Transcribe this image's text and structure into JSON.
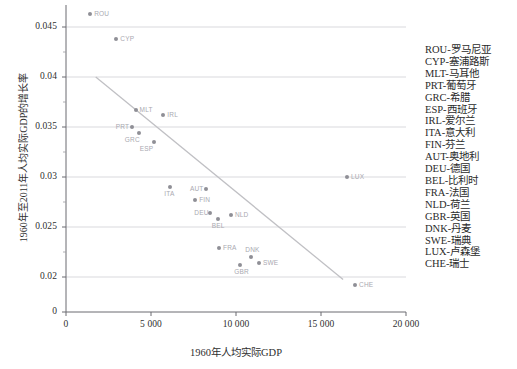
{
  "chart_data": {
    "type": "scatter",
    "title": "",
    "xlabel": "1960年人均实际GDP",
    "ylabel": "1960年至2011年人均实际GDP的增长率",
    "xlim": [
      0,
      20000
    ],
    "ylim": [
      0,
      0.0475
    ],
    "grid": true,
    "legend_position": "right",
    "x_ticks": [
      {
        "value": 0,
        "label": "0"
      },
      {
        "value": 5000,
        "label": "5 000"
      },
      {
        "value": 10000,
        "label": "10 000"
      },
      {
        "value": 15000,
        "label": "15 000"
      },
      {
        "value": 20000,
        "label": "20 000"
      }
    ],
    "y_ticks": [
      {
        "value": 0.045,
        "label": "0.045"
      },
      {
        "value": 0.04,
        "label": "0.04"
      },
      {
        "value": 0.035,
        "label": "0.035"
      },
      {
        "value": 0.03,
        "label": "0.03"
      },
      {
        "value": 0.025,
        "label": "0.025"
      },
      {
        "value": 0.02,
        "label": "0.02"
      },
      {
        "value": 0.0,
        "label": "0"
      }
    ],
    "y_axis_break": true,
    "point_color": "#8f8f96",
    "label_color": "#a9a9b0",
    "trendline_color": "#c0c0c4",
    "gridline_color": "#cfcfd4",
    "trendline": {
      "x0": 1750,
      "y0": 0.04,
      "x1": 16300,
      "y1": 0.018
    },
    "points": [
      {
        "code": "ROU",
        "x": 1420,
        "y": 0.04635,
        "label_pos": "right"
      },
      {
        "code": "CYP",
        "x": 2960,
        "y": 0.04385,
        "label_pos": "right"
      },
      {
        "code": "MLT",
        "x": 4090,
        "y": 0.0367,
        "label_pos": "right"
      },
      {
        "code": "IRL",
        "x": 5720,
        "y": 0.0362,
        "label_pos": "right"
      },
      {
        "code": "PRT",
        "x": 3870,
        "y": 0.03505,
        "label_pos": "left"
      },
      {
        "code": "GRC",
        "x": 4280,
        "y": 0.0344,
        "label_pos": "below-left"
      },
      {
        "code": "ESP",
        "x": 5160,
        "y": 0.03355,
        "label_pos": "below-left"
      },
      {
        "code": "ITA",
        "x": 6130,
        "y": 0.029,
        "label_pos": "below"
      },
      {
        "code": "AUT",
        "x": 8230,
        "y": 0.0288,
        "label_pos": "left"
      },
      {
        "code": "FIN",
        "x": 7600,
        "y": 0.0277,
        "label_pos": "right"
      },
      {
        "code": "DEU",
        "x": 8490,
        "y": 0.0264,
        "label_pos": "left"
      },
      {
        "code": "NLD",
        "x": 9700,
        "y": 0.0262,
        "label_pos": "right"
      },
      {
        "code": "BEL",
        "x": 8930,
        "y": 0.0258,
        "label_pos": "below"
      },
      {
        "code": "FRA",
        "x": 9000,
        "y": 0.0229,
        "label_pos": "right"
      },
      {
        "code": "DNK",
        "x": 10900,
        "y": 0.022,
        "label_pos": "above"
      },
      {
        "code": "SWE",
        "x": 11350,
        "y": 0.0214,
        "label_pos": "right"
      },
      {
        "code": "GBR",
        "x": 10250,
        "y": 0.0212,
        "label_pos": "below"
      },
      {
        "code": "LUX",
        "x": 16530,
        "y": 0.03,
        "label_pos": "right"
      },
      {
        "code": "CHE",
        "x": 17000,
        "y": 0.0137,
        "label_pos": "right"
      }
    ]
  },
  "legend": {
    "items": [
      "ROU-罗马尼亚",
      "CYP-塞浦路斯",
      "MLT-马耳他",
      "PRT-葡萄牙",
      "GRC-希腊",
      "ESP-西班牙",
      "IRL-爱尔兰",
      "ITA-意大利",
      "FIN-芬兰",
      "AUT-奥地利",
      "DEU-德国",
      "BEL-比利时",
      "FRA-法国",
      "NLD-荷兰",
      "GBR-英国",
      "DNK-丹麦",
      "SWE-瑞典",
      "LUX-卢森堡",
      "CHE-瑞士"
    ]
  }
}
